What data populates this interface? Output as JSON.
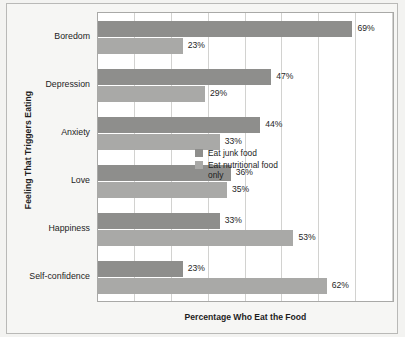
{
  "figure": {
    "background_color": "#f6f6f4",
    "frame_color": "#b9b9b7"
  },
  "axes": {
    "y_title": "Feeling That Triggers Eating",
    "x_title": "Percentage Who Eat the Food"
  },
  "legend": {
    "items": [
      {
        "label": "Eat junk food",
        "color": "#8e8e8c",
        "swatch_name": "legend-swatch-junk"
      },
      {
        "label": "Eat nutritional food only",
        "color": "#a9a9a7",
        "swatch_name": "legend-swatch-nutritional"
      }
    ]
  },
  "chart_data": {
    "type": "bar",
    "orientation": "horizontal",
    "title": "",
    "xlabel": "Percentage Who Eat the Food",
    "ylabel": "Feeling That Triggers Eating",
    "xlim": [
      0,
      80
    ],
    "grid": true,
    "gridlines_x": [
      0,
      10,
      20,
      30,
      40,
      50,
      60,
      70,
      80
    ],
    "legend_position": "inside-right-middle",
    "categories": [
      "Boredom",
      "Depression",
      "Anxiety",
      "Love",
      "Happiness",
      "Self-confidence"
    ],
    "series": [
      {
        "name": "Eat junk food",
        "color": "#8e8e8c",
        "values": [
          69,
          47,
          44,
          36,
          33,
          23
        ],
        "labels": [
          "69%",
          "47%",
          "44%",
          "36%",
          "33%",
          "23%"
        ]
      },
      {
        "name": "Eat nutritional food only",
        "color": "#a9a9a7",
        "values": [
          23,
          29,
          33,
          35,
          53,
          62
        ],
        "labels": [
          "23%",
          "29%",
          "33%",
          "35%",
          "53%",
          "62%"
        ]
      }
    ]
  }
}
